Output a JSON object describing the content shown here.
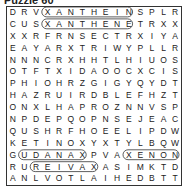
{
  "puzzle": {
    "title": "Puzzle 60",
    "rows": [
      "DRVXANTHEINSPLR",
      "CUSXANTHENETRXX",
      "XXRFRNSECTRXIYA",
      "EAYARXTRIWYPLLR",
      "NNNCRXHHTLHIUOS",
      "OTFTXIDAOOCXCIS",
      "PHIOHRZGIGYQYDT",
      "HAZRUIRDBLEFHZT",
      "ONXLHAPROZNNVSP",
      "NPDEPQOPNSEJEAC",
      "QUSHRFHOEELIPDW",
      "KETINOXYXTYLBQW",
      "GUDANAXPVAXENON",
      "RUREIVAXASIMKTD",
      "ANLVOTLAIHEDBTT"
    ],
    "found_words": [
      "XANTHEIN",
      "XANTHENE",
      "XENON",
      "REIVAX",
      "UDANAX"
    ]
  }
}
